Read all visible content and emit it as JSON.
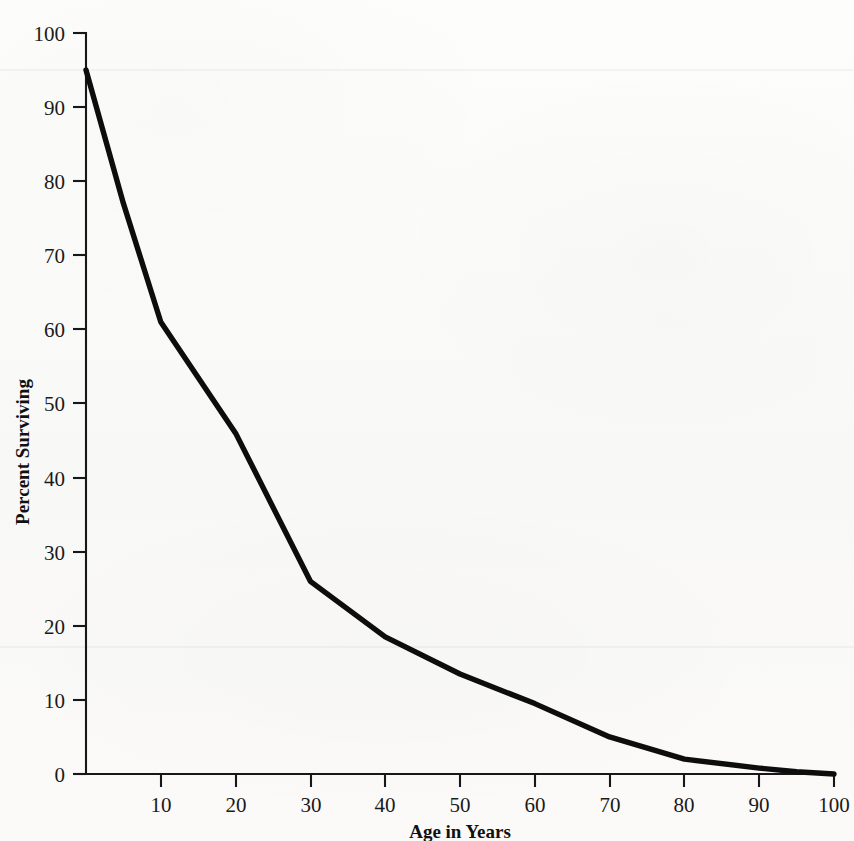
{
  "chart_data": {
    "type": "line",
    "title": "",
    "xlabel": "Age in Years",
    "ylabel": "Percent Surviving",
    "xlim": [
      0,
      100
    ],
    "ylim": [
      0,
      100
    ],
    "xticks": [
      0,
      10,
      20,
      30,
      40,
      50,
      60,
      70,
      80,
      90,
      100
    ],
    "xtick_labels": [
      "",
      "10",
      "20",
      "30",
      "40",
      "50",
      "60",
      "70",
      "80",
      "90",
      "100"
    ],
    "yticks": [
      0,
      10,
      20,
      30,
      40,
      50,
      60,
      70,
      80,
      90,
      100
    ],
    "ytick_labels": [
      "0",
      "10",
      "20",
      "30",
      "40",
      "50",
      "60",
      "70",
      "80",
      "90",
      "100"
    ],
    "grid": false,
    "legend": null,
    "series": [
      {
        "name": "Percent Surviving",
        "color": "#0d0d0d",
        "x": [
          0,
          5,
          10,
          20,
          30,
          40,
          50,
          60,
          70,
          80,
          90,
          95,
          100
        ],
        "values": [
          95,
          77,
          61,
          46,
          26,
          18.5,
          13.5,
          9.5,
          5,
          2,
          0.8,
          0.3,
          0
        ]
      }
    ]
  },
  "axes": {
    "x_axis_title": "Age in Years",
    "y_axis_title": "Percent Surviving",
    "x_tick_text": [
      "10",
      "20",
      "30",
      "40",
      "50",
      "60",
      "70",
      "80",
      "90",
      "100"
    ],
    "y_tick_text": [
      "0",
      "10",
      "20",
      "30",
      "40",
      "50",
      "60",
      "70",
      "80",
      "90",
      "100"
    ]
  }
}
